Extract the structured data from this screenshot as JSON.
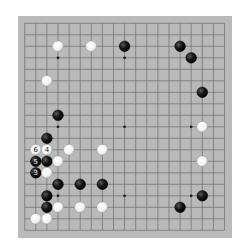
{
  "board": {
    "size": 19,
    "colors": {
      "board": "#b9b9b9",
      "line": "#6e6e6e",
      "black": "#151515",
      "white": "#f2f2f2",
      "star": "#222222"
    },
    "star_points": [
      [
        4,
        4
      ],
      [
        10,
        4
      ],
      [
        16,
        4
      ],
      [
        4,
        10
      ],
      [
        10,
        10
      ],
      [
        16,
        10
      ],
      [
        4,
        16
      ],
      [
        10,
        16
      ],
      [
        16,
        16
      ]
    ],
    "stones": [
      {
        "color": "white",
        "col": 4,
        "row": 3,
        "label": ""
      },
      {
        "color": "white",
        "col": 7,
        "row": 3,
        "label": ""
      },
      {
        "color": "black",
        "col": 10,
        "row": 3,
        "label": ""
      },
      {
        "color": "black",
        "col": 15,
        "row": 3,
        "label": ""
      },
      {
        "color": "black",
        "col": 16,
        "row": 4,
        "label": ""
      },
      {
        "color": "white",
        "col": 3,
        "row": 6,
        "label": ""
      },
      {
        "color": "black",
        "col": 17,
        "row": 7,
        "label": ""
      },
      {
        "color": "black",
        "col": 4,
        "row": 9,
        "label": ""
      },
      {
        "color": "white",
        "col": 17,
        "row": 10,
        "label": ""
      },
      {
        "color": "black",
        "col": 3,
        "row": 11,
        "label": ""
      },
      {
        "color": "white",
        "col": 2,
        "row": 12,
        "label": "6"
      },
      {
        "color": "white",
        "col": 3,
        "row": 12,
        "label": "4"
      },
      {
        "color": "white",
        "col": 5,
        "row": 12,
        "label": ""
      },
      {
        "color": "white",
        "col": 8,
        "row": 12,
        "label": ""
      },
      {
        "color": "black",
        "col": 2,
        "row": 13,
        "label": "5"
      },
      {
        "color": "black",
        "col": 3,
        "row": 13,
        "label": ""
      },
      {
        "color": "white",
        "col": 4,
        "row": 13,
        "label": ""
      },
      {
        "color": "white",
        "col": 17,
        "row": 13,
        "label": ""
      },
      {
        "color": "black",
        "col": 2,
        "row": 14,
        "label": "3"
      },
      {
        "color": "white",
        "col": 3,
        "row": 14,
        "label": ""
      },
      {
        "color": "black",
        "col": 4,
        "row": 15,
        "label": ""
      },
      {
        "color": "black",
        "col": 6,
        "row": 15,
        "label": ""
      },
      {
        "color": "black",
        "col": 8,
        "row": 15,
        "label": ""
      },
      {
        "color": "black",
        "col": 3,
        "row": 16,
        "label": ""
      },
      {
        "color": "black",
        "col": 17,
        "row": 16,
        "label": ""
      },
      {
        "color": "black",
        "col": 3,
        "row": 17,
        "label": ""
      },
      {
        "color": "white",
        "col": 4,
        "row": 17,
        "label": ""
      },
      {
        "color": "white",
        "col": 6,
        "row": 17,
        "label": ""
      },
      {
        "color": "white",
        "col": 8,
        "row": 17,
        "label": ""
      },
      {
        "color": "black",
        "col": 15,
        "row": 17,
        "label": ""
      },
      {
        "color": "white",
        "col": 2,
        "row": 18,
        "label": ""
      },
      {
        "color": "white",
        "col": 3,
        "row": 18,
        "label": ""
      }
    ]
  }
}
